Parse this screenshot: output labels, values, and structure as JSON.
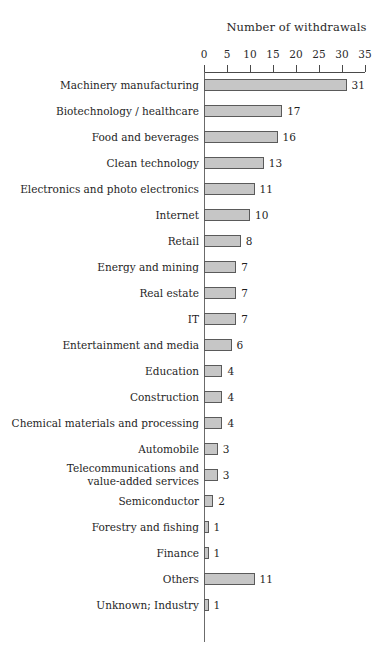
{
  "chart_data": {
    "type": "bar",
    "orientation": "horizontal",
    "title": "Number of withdrawals",
    "xlabel": "",
    "ylabel": "",
    "xlim": [
      0,
      35
    ],
    "xticks": [
      0,
      5,
      10,
      15,
      20,
      25,
      30,
      35
    ],
    "grid": false,
    "legend": false,
    "data_labels": true,
    "categories": [
      "Machinery manufacturing",
      "Biotechnology / healthcare",
      "Food and beverages",
      "Clean technology",
      "Electronics and photo electronics",
      "Internet",
      "Retail",
      "Energy and mining",
      "Real estate",
      "IT",
      "Entertainment and media",
      "Education",
      "Construction",
      "Chemical materials and processing",
      "Automobile",
      "Telecommunications and\nvalue-added services",
      "Semiconductor",
      "Forestry and fishing",
      "Finance",
      "Others",
      "Unknown; Industry"
    ],
    "values": [
      31,
      17,
      16,
      13,
      11,
      10,
      8,
      7,
      7,
      7,
      6,
      4,
      4,
      4,
      3,
      3,
      2,
      1,
      1,
      11,
      1
    ],
    "bar_fill_color": "#c6c6c6",
    "bar_border_color": "#5a5a5a",
    "axis_color": "#4a4a4a",
    "text_color": "#1f1f1f"
  }
}
